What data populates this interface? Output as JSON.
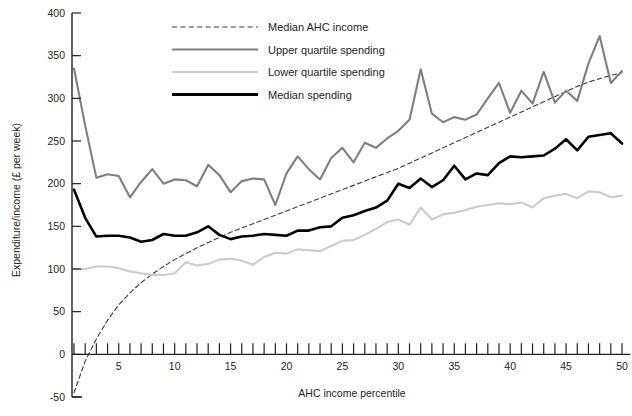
{
  "chart_data": {
    "type": "line",
    "title": "",
    "xlabel": "AHC income percentile",
    "ylabel": "Expenditure/income (£ per week)",
    "xlim": [
      1,
      50
    ],
    "ylim": [
      -50,
      400
    ],
    "ytick_labels": [
      "-50",
      "0",
      "50",
      "100",
      "150",
      "200",
      "250",
      "300",
      "350",
      "400"
    ],
    "ytick_values": [
      -50,
      0,
      50,
      100,
      150,
      200,
      250,
      300,
      350,
      400
    ],
    "xtick_labels": [
      "5",
      "10",
      "15",
      "20",
      "25",
      "30",
      "35",
      "40",
      "45",
      "50"
    ],
    "xtick_values": [
      5,
      10,
      15,
      20,
      25,
      30,
      35,
      40,
      45,
      50
    ],
    "xtick_minor_step": 1,
    "grid": false,
    "legend_position": "top-center",
    "x": [
      1,
      2,
      3,
      4,
      5,
      6,
      7,
      8,
      9,
      10,
      11,
      12,
      13,
      14,
      15,
      16,
      17,
      18,
      19,
      20,
      21,
      22,
      23,
      24,
      25,
      26,
      27,
      28,
      29,
      30,
      31,
      32,
      33,
      34,
      35,
      36,
      37,
      38,
      39,
      40,
      41,
      42,
      43,
      44,
      45,
      46,
      47,
      48,
      49,
      50
    ],
    "series": [
      {
        "name": "Median AHC income",
        "color": "#3c3c3c",
        "style": "dashed",
        "width": 1.1,
        "values": [
          -45,
          -8,
          18,
          40,
          58,
          72,
          84,
          94,
          103,
          111,
          118,
          125,
          131,
          137,
          143,
          148,
          153,
          158,
          163,
          168,
          173,
          178,
          183,
          188,
          193,
          198,
          203,
          208,
          213,
          218,
          224,
          230,
          236,
          242,
          248,
          254,
          260,
          266,
          272,
          278,
          284,
          290,
          296,
          302,
          308,
          314,
          319,
          323,
          327,
          330
        ]
      },
      {
        "name": "Upper quartile spending",
        "color": "#7f7f7f",
        "style": "solid",
        "width": 2.1,
        "values": [
          335,
          268,
          207,
          211,
          209,
          184,
          202,
          217,
          200,
          205,
          204,
          197,
          222,
          210,
          190,
          203,
          206,
          205,
          175,
          212,
          232,
          217,
          205,
          230,
          242,
          225,
          248,
          242,
          253,
          262,
          275,
          334,
          282,
          272,
          278,
          275,
          281,
          300,
          318,
          283,
          309,
          294,
          331,
          295,
          309,
          297,
          341,
          373,
          318,
          332
        ]
      },
      {
        "name": "Lower quartile spending",
        "color": "#cbcbcb",
        "style": "solid",
        "width": 2.1,
        "values": [
          100,
          100,
          103,
          103,
          101,
          97,
          95,
          93,
          93,
          95,
          108,
          104,
          106,
          111,
          112,
          110,
          105,
          114,
          119,
          118,
          123,
          122,
          121,
          127,
          133,
          134,
          140,
          147,
          155,
          158,
          152,
          172,
          158,
          164,
          166,
          169,
          173,
          175,
          177,
          176,
          178,
          172,
          183,
          186,
          188,
          183,
          191,
          190,
          184,
          186
        ]
      },
      {
        "name": "Median spending",
        "color": "#000000",
        "style": "solid",
        "width": 2.6,
        "values": [
          193,
          160,
          138,
          139,
          139,
          137,
          132,
          134,
          141,
          139,
          139,
          143,
          150,
          140,
          135,
          138,
          139,
          141,
          140,
          139,
          145,
          145,
          149,
          150,
          160,
          163,
          168,
          172,
          180,
          200,
          195,
          206,
          196,
          204,
          221,
          205,
          212,
          210,
          224,
          232,
          231,
          232,
          233,
          241,
          252,
          239,
          255,
          257,
          259,
          247
        ]
      }
    ]
  },
  "legend": {
    "items": [
      {
        "label": "Median AHC income",
        "color": "#3c3c3c",
        "style": "dashed"
      },
      {
        "label": "Upper quartile spending",
        "color": "#7f7f7f",
        "style": "solid"
      },
      {
        "label": "Lower quartile spending",
        "color": "#cbcbcb",
        "style": "solid"
      },
      {
        "label": "Median spending",
        "color": "#000000",
        "style": "solid"
      }
    ]
  }
}
